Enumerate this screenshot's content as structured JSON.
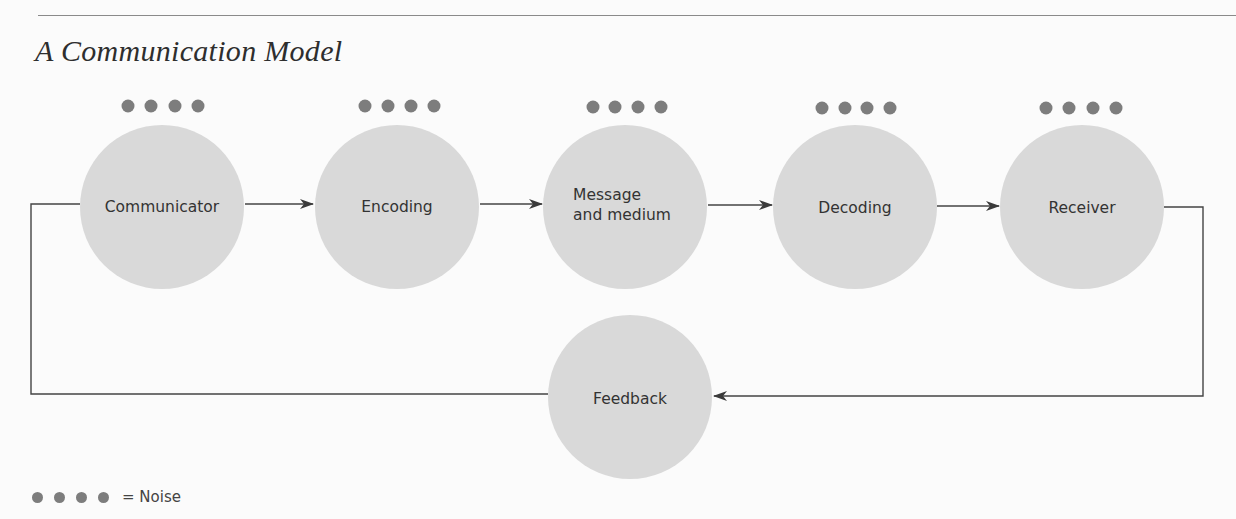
{
  "title": "A Communication Model",
  "nodes": [
    {
      "id": "communicator",
      "label": "Communicator",
      "cx": 162,
      "cy": 207
    },
    {
      "id": "encoding",
      "label": "Encoding",
      "cx": 397,
      "cy": 207
    },
    {
      "id": "message",
      "label": "Message\nand medium",
      "line1": "Message",
      "line2": "and medium",
      "cx": 625,
      "cy": 207
    },
    {
      "id": "decoding",
      "label": "Decoding",
      "cx": 855,
      "cy": 207
    },
    {
      "id": "receiver",
      "label": "Receiver",
      "cx": 1082,
      "cy": 207
    },
    {
      "id": "feedback",
      "label": "Feedback",
      "cx": 630,
      "cy": 397
    }
  ],
  "edges": [
    {
      "from": "communicator",
      "to": "encoding"
    },
    {
      "from": "encoding",
      "to": "message"
    },
    {
      "from": "message",
      "to": "decoding"
    },
    {
      "from": "decoding",
      "to": "receiver"
    },
    {
      "from": "receiver",
      "to": "feedback"
    },
    {
      "from": "feedback",
      "to": "communicator"
    }
  ],
  "legend": {
    "symbol": "four dots",
    "label": "= Noise"
  },
  "colors": {
    "circle": "#d9d9d9",
    "noise_dot": "#7d7d7d",
    "line": "#444444"
  }
}
